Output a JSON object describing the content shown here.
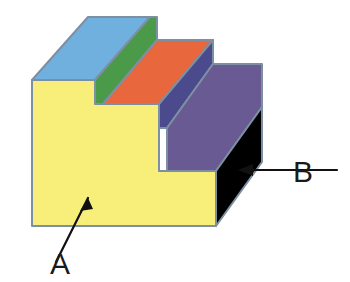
{
  "figure": {
    "background_color": "#ffffff",
    "edge_color": "#7d8fa3",
    "labels": [
      {
        "id": "A",
        "text": "A",
        "points_to": "front-vertical-face",
        "text_x": 60,
        "text_y": 274,
        "arrow_tail_x": 56,
        "arrow_tail_y": 262,
        "arrow_tip_x": 88,
        "arrow_tip_y": 198
      },
      {
        "id": "B",
        "text": "B",
        "points_to": "right-side-face",
        "text_x": 303,
        "text_y": 182,
        "arrow_tail_x": 337,
        "arrow_tail_y": 170,
        "arrow_tip_x": 240,
        "arrow_tip_y": 170
      }
    ],
    "faces": [
      {
        "name": "top-tread-face-1",
        "color": "#6fb0df",
        "color_name": "light-blue",
        "points": "32,80 88,17 150,17 95,80"
      },
      {
        "name": "riser-face-1",
        "color": "#4a9a4a",
        "color_name": "green",
        "points": "95,80 150,17 157,17 103,80"
      },
      {
        "name": "riser-face-1-lower",
        "color": "#4a9a4a",
        "color_name": "green",
        "points": "95,80 157,17 157,40 103,104 95,104"
      },
      {
        "name": "top-tread-face-2",
        "color": "#e8673c",
        "color_name": "orange-red",
        "points": "103,104 157,40 213,40 159,104"
      },
      {
        "name": "riser-face-2",
        "color": "#4a4a8c",
        "color_name": "navy-blue",
        "points": "159,104 213,40 213,64 167,128 159,128"
      },
      {
        "name": "top-tread-face-3",
        "color": "#6a5a94",
        "color_name": "purple",
        "points": "167,128 213,64 262,64 216,128"
      },
      {
        "name": "riser-face-3",
        "color": "#6a5a94",
        "color_name": "purple",
        "points": "167,128 262,64 262,107 216,171 167,171"
      },
      {
        "name": "right-side-face",
        "color": "#f5a council",
        "color_name": "orange",
        "points": "216,171 262,107 262,162 216,226"
      },
      {
        "name": "front-vertical-face",
        "color": "#f7ef7a",
        "color_name": "yellow",
        "points": "32,80 95,80 95,104 159,104 159,171 216,171 216,226 32,226"
      }
    ]
  }
}
